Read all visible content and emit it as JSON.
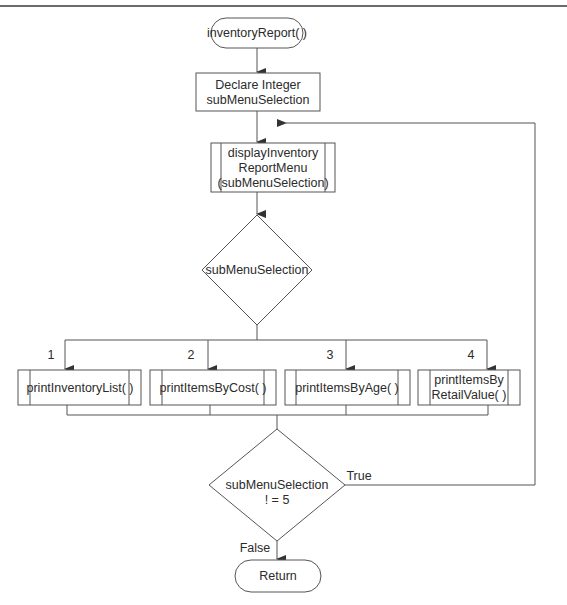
{
  "flowchart": {
    "start": {
      "label": "inventoryReport( )"
    },
    "declare": {
      "line1": "Declare Integer",
      "line2": "subMenuSelection"
    },
    "display_menu": {
      "line1": "displayInventory",
      "line2": "ReportMenu",
      "line3": "(subMenuSelection)"
    },
    "selection_decision": {
      "label": "subMenuSelection"
    },
    "branches": [
      {
        "case": "1",
        "module": "printInventoryList( )"
      },
      {
        "case": "2",
        "module": "printItemsByCost( )"
      },
      {
        "case": "3",
        "module": "printItemsByAge( )"
      },
      {
        "case": "4",
        "module_line1": "printItemsBy",
        "module_line2": "RetailValue( )"
      }
    ],
    "loop_decision": {
      "line1": "subMenuSelection",
      "line2": "! = 5",
      "true_label": "True",
      "false_label": "False"
    },
    "end": {
      "label": "Return"
    }
  },
  "colors": {
    "stroke": "#555555",
    "rule": "#6b6b6b",
    "text": "#2b2b2b"
  }
}
